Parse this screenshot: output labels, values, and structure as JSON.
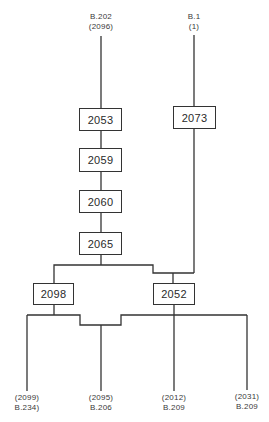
{
  "diagram": {
    "type": "genealogy-flow",
    "line_color": "#333333",
    "sources": [
      {
        "id": "src-left",
        "line1": "B.202",
        "line2": "(2096)"
      },
      {
        "id": "src-right",
        "line1": "B.1",
        "line2": "(1)"
      }
    ],
    "nodes": [
      {
        "id": "n2053",
        "label": "2053"
      },
      {
        "id": "n2059",
        "label": "2059"
      },
      {
        "id": "n2060",
        "label": "2060"
      },
      {
        "id": "n2065",
        "label": "2065"
      },
      {
        "id": "n2073",
        "label": "2073"
      },
      {
        "id": "n2098",
        "label": "2098"
      },
      {
        "id": "n2052",
        "label": "2052"
      }
    ],
    "edges": [
      [
        "src-left",
        "n2053"
      ],
      [
        "n2053",
        "n2059"
      ],
      [
        "n2059",
        "n2060"
      ],
      [
        "n2060",
        "n2065"
      ],
      [
        "src-right",
        "n2073"
      ],
      [
        "n2065",
        "n2098"
      ],
      [
        "n2065",
        "n2052"
      ],
      [
        "n2073",
        "n2052"
      ],
      [
        "n2098",
        "out-1"
      ],
      [
        "n2098",
        "out-2"
      ],
      [
        "n2052",
        "out-2"
      ],
      [
        "n2052",
        "out-3"
      ],
      [
        "n2052",
        "out-4"
      ]
    ],
    "outputs": [
      {
        "id": "out-1",
        "line1": "(2099)",
        "line2": "B.234)"
      },
      {
        "id": "out-2",
        "line1": "(2095)",
        "line2": "B.206"
      },
      {
        "id": "out-3",
        "line1": "(2012)",
        "line2": "B.209"
      },
      {
        "id": "out-4",
        "line1": "(2031)",
        "line2": "B.209"
      }
    ]
  }
}
